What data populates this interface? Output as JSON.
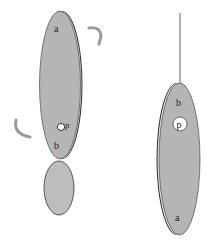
{
  "diagram": {
    "colors": {
      "body_fill": "#b5b5b5",
      "rim": "#2a2a2a",
      "arrow": "#9a9a9a",
      "pivot_fill": "#ffffff",
      "string": "#555555"
    },
    "left_figure": {
      "label_top": "a",
      "label_bottom": "b",
      "pivot_label": "p",
      "rotation_arrows": [
        "clockwise-arrow-top-right",
        "counterclockwise-arrow-left"
      ]
    },
    "right_figure": {
      "label_top": "b",
      "label_bottom": "a",
      "pivot_label": "p"
    }
  }
}
